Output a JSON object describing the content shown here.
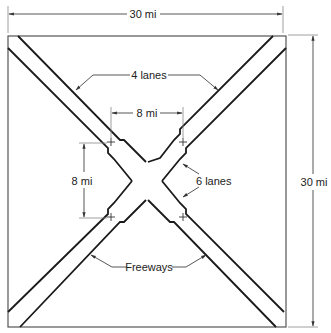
{
  "diagram": {
    "type": "freeway-network-schematic",
    "dimensions": {
      "width_label": "30 mi",
      "height_label": "30 mi",
      "inner_horizontal_label": "8 mi",
      "inner_vertical_label": "8 mi"
    },
    "callouts": {
      "outer_lanes": "4 lanes",
      "inner_lanes": "6 lanes",
      "freeways": "Freeways"
    },
    "colors": {
      "line": "#1a1a1a",
      "dim_line": "#555555",
      "background": "#ffffff"
    }
  }
}
